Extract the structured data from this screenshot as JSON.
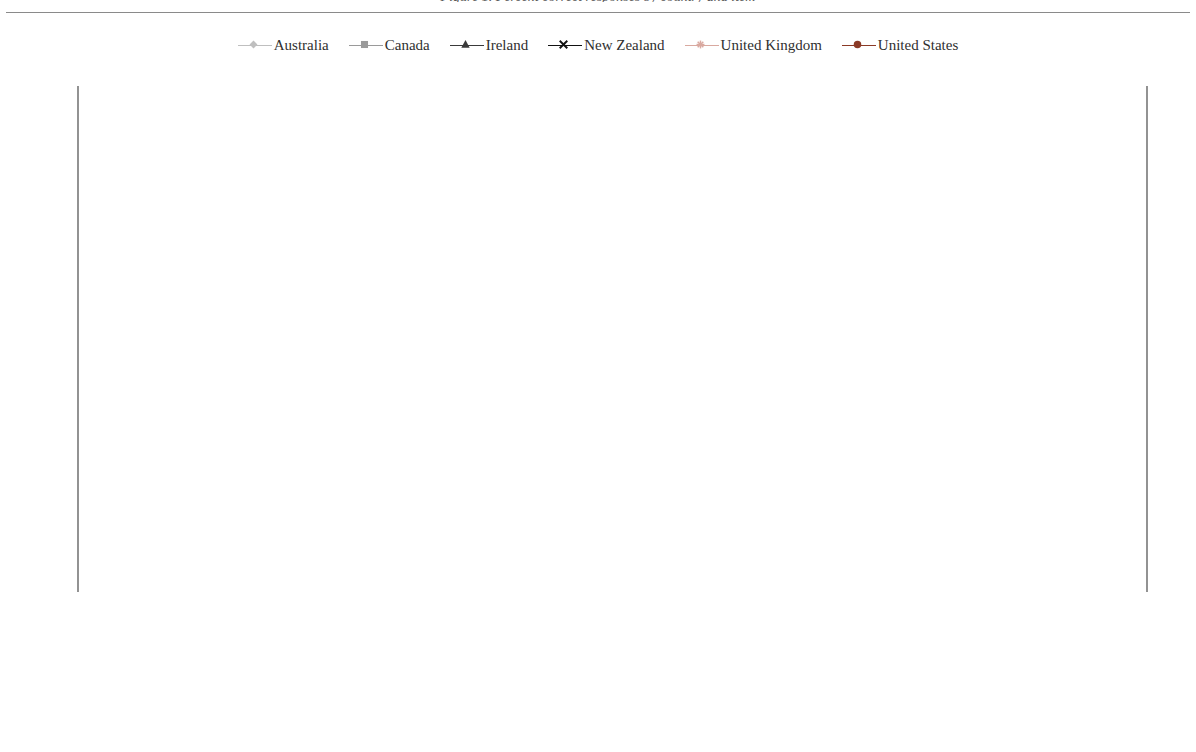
{
  "caption": {
    "text": "Figure 1. Percent correct responses by country and item",
    "note": "clipped at top edge"
  },
  "axes": {
    "ylabel": "Percent correct",
    "yticks": [
      0,
      10,
      20,
      30,
      40,
      50,
      60,
      70,
      80,
      90,
      100
    ],
    "ylim": [
      0,
      100
    ],
    "xlabel": ""
  },
  "legend": {
    "position": "top-center",
    "items": [
      {
        "label": "Australia",
        "color": "#BFBFBF",
        "marker": "diamond"
      },
      {
        "label": "Canada",
        "color": "#9A9A9A",
        "marker": "square"
      },
      {
        "label": "Ireland",
        "color": "#3A3A3A",
        "marker": "triangle"
      },
      {
        "label": "New Zealand",
        "color": "#111111",
        "marker": "x"
      },
      {
        "label": "United Kingdom",
        "color": "#D9A9A0",
        "marker": "star"
      },
      {
        "label": "United States",
        "color": "#8B3A26",
        "marker": "circle"
      }
    ]
  },
  "chart_data": {
    "type": "line",
    "title": "",
    "xlabel": "",
    "ylabel": "Percent correct",
    "ylim": [
      0,
      100
    ],
    "ytick_step": 10,
    "grid": true,
    "legend_position": "top-center",
    "categories": [
      "EXCHANGE RATE Q1",
      "EXCHANGE RATE Q2",
      "BICYCLES Q2",
      "CHAIR LIFT Q1",
      "EXPORTS Q2",
      "CHAIR LIFT Q2",
      "EXCHANGE RATE Q3",
      "CARBON DIOXIDE Q3",
      "BICYCLES Q3",
      "POPULATION PYRAMIDS Q3",
      "THE TERMOMETER CRICKET Q2"
    ],
    "categories_wrapped": [
      [
        "EXCHANGE RATE Q1"
      ],
      [
        "EXCHANGE RATE Q2"
      ],
      [
        "BICYCLES Q2"
      ],
      [
        "CHAIR LIFT Q1"
      ],
      [
        "EXPORTS Q2"
      ],
      [
        "CHAIR LIFT Q2"
      ],
      [
        "EXCHANGE RATE Q3"
      ],
      [
        "CARBON DIOXIDE",
        "Q3"
      ],
      [
        "BICYCLES Q3"
      ],
      [
        "POPULATION",
        "PYRAMIDS Q3"
      ],
      [
        "THE TERMOMETER",
        "CRICKET Q2"
      ]
    ],
    "series": [
      {
        "name": "Australia",
        "color": "#BFBFBF",
        "marker": "diamond",
        "values": [
          80.0,
          78.0,
          80.3,
          47.0,
          47.0,
          50.0,
          46.7,
          36.8,
          21.8,
          21.0,
          10.5
        ]
      },
      {
        "name": "Canada",
        "color": "#9A9A9A",
        "marker": "square",
        "values": [
          86.3,
          81.3,
          80.3,
          53.2,
          52.6,
          51.3,
          58.6,
          36.8,
          24.3,
          26.0,
          10.3
        ]
      },
      {
        "name": "Ireland",
        "color": "#3A3A3A",
        "marker": "triangle",
        "values": [
          83.2,
          76.5,
          75.9,
          46.2,
          47.0,
          47.8,
          42.0,
          36.5,
          14.2,
          22.0,
          4.4
        ]
      },
      {
        "name": "New Zealand",
        "color": "#111111",
        "marker": "x",
        "values": [
          80.0,
          72.5,
          72.8,
          46.5,
          47.5,
          47.9,
          41.8,
          33.2,
          21.6,
          21.4,
          10.3
        ]
      },
      {
        "name": "United Kingdom",
        "color": "#D9A9A0",
        "marker": "star",
        "values": [
          73.8,
          67.0,
          65.3,
          40.8,
          40.2,
          39.5,
          43.7,
          36.4,
          21.8,
          22.5,
          9.8
        ]
      },
      {
        "name": "United States",
        "color": "#8B3A26",
        "marker": "circle",
        "values": [
          54.0,
          68.1,
          65.2,
          45.3,
          44.1,
          42.2,
          38.2,
          28.0,
          16.2,
          16.4,
          7.3
        ]
      }
    ]
  }
}
